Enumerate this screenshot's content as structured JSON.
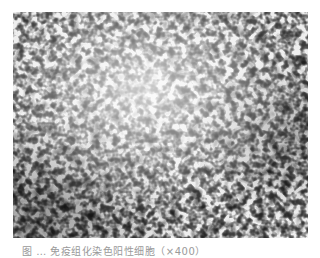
{
  "figure": {
    "type": "micrograph",
    "colors": {
      "background": "#ffffff",
      "tissue_light": "#efefef",
      "stain_dark": "#1a1a1a"
    }
  },
  "caption": {
    "text": "图 … 免疫组化染色阳性细胞（×400）"
  }
}
